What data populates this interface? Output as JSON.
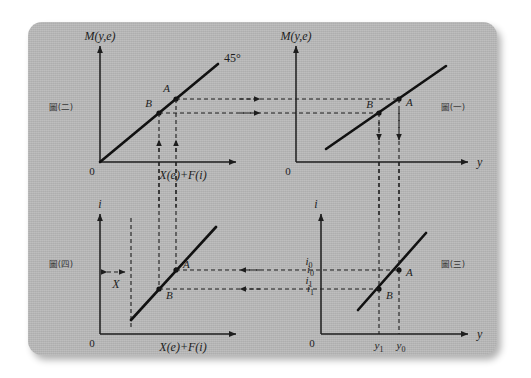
{
  "figure": {
    "card_color": "#b9b9b9",
    "ink_color": "#1d1d1d"
  },
  "captions": {
    "top_left": "圖(二)",
    "top_right": "圖(一)",
    "bottom_left": "圖(四)",
    "bottom_right": "圖(三)"
  },
  "panels": {
    "top_left": {
      "name": "45-degree money balance panel",
      "y_axis_label": "M(y,e)",
      "x_axis_label": "X(e)+F(i)",
      "origin_label": "0",
      "line_label": "45°",
      "points": [
        {
          "label": "B",
          "x": 0.42,
          "y": 0.42
        },
        {
          "label": "A",
          "x": 0.56,
          "y": 0.56
        }
      ]
    },
    "top_right": {
      "name": "money demand versus income panel",
      "y_axis_label": "M(y,e)",
      "x_axis_label": "y",
      "origin_label": "0",
      "points": [
        {
          "label": "B",
          "x": 0.62,
          "y": 0.42
        },
        {
          "label": "A",
          "x": 0.76,
          "y": 0.56
        }
      ]
    },
    "bottom_left": {
      "name": "interest rate versus net exports panel",
      "y_axis_label": "i",
      "x_axis_label": "X(e)+F(i)",
      "origin_label": "0",
      "gap_label": "X",
      "points": [
        {
          "label": "A",
          "x": 0.56,
          "y": 0.58
        },
        {
          "label": "B",
          "x": 0.42,
          "y": 0.37
        }
      ]
    },
    "bottom_right": {
      "name": "IS curve panel",
      "y_axis_label": "i",
      "x_axis_label": "y",
      "origin_label": "0",
      "y_ticks": [
        {
          "label": "i",
          "sub": "0",
          "value": 0.58
        },
        {
          "label": "i",
          "sub": "1",
          "value": 0.37
        }
      ],
      "x_ticks": [
        {
          "label": "y",
          "sub": "1",
          "value": 0.62
        },
        {
          "label": "y",
          "sub": "0",
          "value": 0.76
        }
      ],
      "points": [
        {
          "label": "A",
          "x": 0.76,
          "y": 0.58
        },
        {
          "label": "B",
          "x": 0.62,
          "y": 0.37
        }
      ]
    }
  },
  "connectors": {
    "top_transfer_labels": [],
    "bottom_transfer_labels": [
      {
        "label": "i",
        "sub": "0"
      },
      {
        "label": "i",
        "sub": "1"
      }
    ]
  }
}
